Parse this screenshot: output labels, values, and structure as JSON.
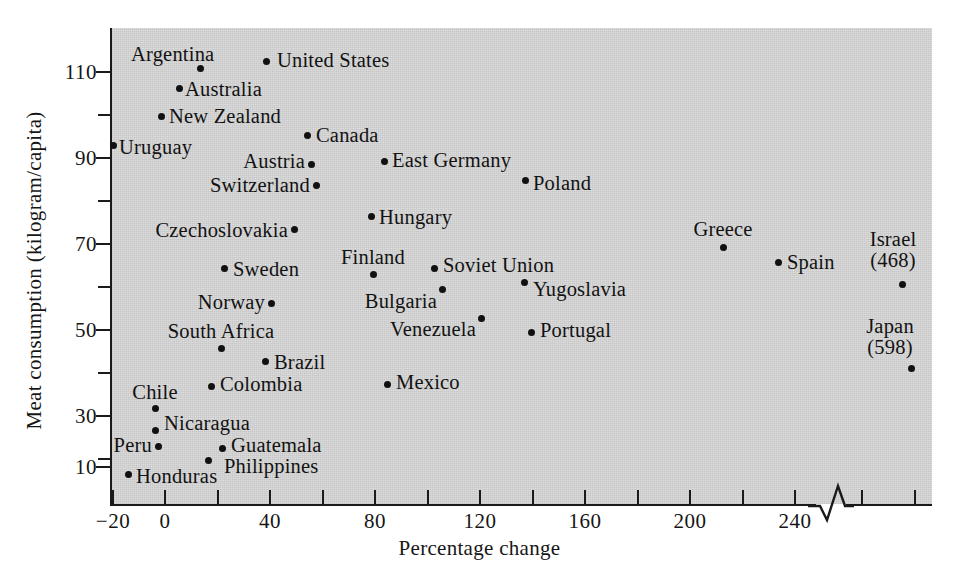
{
  "chart_data": {
    "type": "scatter",
    "title": "",
    "xlabel": "Percentage change",
    "ylabel": "Meat consumption (kilogram/capita)",
    "xlim": [
      -26,
      270
    ],
    "ylim": [
      0,
      118
    ],
    "grid": false,
    "legend": "none",
    "axis_break": {
      "present": true,
      "after_tick": 240,
      "style": "zigzag",
      "note": "x-axis is broken after 240; two rightmost points are plotted off-scale with their true values annotated in parentheses"
    },
    "xticks": [
      -20,
      0,
      20,
      40,
      60,
      80,
      100,
      120,
      140,
      160,
      180,
      200,
      220,
      240
    ],
    "xtick_labels": [
      "-20",
      "0",
      "",
      "40",
      "",
      "80",
      "",
      "120",
      "",
      "160",
      "",
      "200",
      "",
      "240"
    ],
    "yticks": [
      10,
      20,
      30,
      40,
      50,
      60,
      70,
      80,
      90,
      100,
      110
    ],
    "ytick_labels": [
      "10",
      "",
      "30",
      "",
      "50",
      "",
      "70",
      "",
      "90",
      "",
      "110"
    ],
    "points": [
      {
        "label": "Argentina",
        "x": 14,
        "y": 110,
        "label_pos": "above-left"
      },
      {
        "label": "United States",
        "x": 39,
        "y": 111,
        "label_pos": "right"
      },
      {
        "label": "Australia",
        "x": 11,
        "y": 105,
        "label_pos": "right"
      },
      {
        "label": "New Zealand",
        "x": 4,
        "y": 98,
        "label_pos": "right"
      },
      {
        "label": "Uruguay",
        "x": -20,
        "y": 90,
        "label_pos": "right"
      },
      {
        "label": "Canada",
        "x": 40,
        "y": 93,
        "label_pos": "right"
      },
      {
        "label": "Austria",
        "x": 41,
        "y": 85,
        "label_pos": "left"
      },
      {
        "label": "East Germany",
        "x": 56,
        "y": 86,
        "label_pos": "right"
      },
      {
        "label": "Switzerland",
        "x": 42,
        "y": 80,
        "label_pos": "left"
      },
      {
        "label": "Poland",
        "x": 134,
        "y": 82,
        "label_pos": "right"
      },
      {
        "label": "Czechoslovakia",
        "x": 24,
        "y": 69,
        "label_pos": "left"
      },
      {
        "label": "Hungary",
        "x": 77,
        "y": 72,
        "label_pos": "right"
      },
      {
        "label": "Greece",
        "x": 214,
        "y": 66,
        "label_pos": "above"
      },
      {
        "label": "Sweden",
        "x": 22,
        "y": 59,
        "label_pos": "right"
      },
      {
        "label": "Finland",
        "x": 79,
        "y": 58,
        "label_pos": "above"
      },
      {
        "label": "Soviet Union",
        "x": 104,
        "y": 59,
        "label_pos": "right"
      },
      {
        "label": "Spain",
        "x": 235,
        "y": 60,
        "label_pos": "right"
      },
      {
        "label": "Israel",
        "x": 468,
        "y": 56,
        "label_pos": "above",
        "offscale": true,
        "annotation": "(468)"
      },
      {
        "label": "Norway",
        "x": 20,
        "y": 52,
        "label_pos": "left"
      },
      {
        "label": "Bulgaria",
        "x": 104,
        "y": 54,
        "label_pos": "below-left"
      },
      {
        "label": "Yugoslavia",
        "x": 139,
        "y": 55,
        "label_pos": "right"
      },
      {
        "label": "South Africa",
        "x": 22,
        "y": 41,
        "label_pos": "above"
      },
      {
        "label": "Venezuela",
        "x": 120,
        "y": 47,
        "label_pos": "left"
      },
      {
        "label": "Portugal",
        "x": 139,
        "y": 43,
        "label_pos": "right"
      },
      {
        "label": "Japan",
        "x": 598,
        "y": 34,
        "label_pos": "above",
        "offscale": true,
        "annotation": "(598)"
      },
      {
        "label": "Brazil",
        "x": 38,
        "y": 36,
        "label_pos": "right"
      },
      {
        "label": "Colombia",
        "x": 20,
        "y": 31,
        "label_pos": "right"
      },
      {
        "label": "Mexico",
        "x": 86,
        "y": 30,
        "label_pos": "right"
      },
      {
        "label": "Chile",
        "x": -4,
        "y": 25,
        "label_pos": "above"
      },
      {
        "label": "Nicaragua",
        "x": -4,
        "y": 19,
        "label_pos": "right"
      },
      {
        "label": "Peru",
        "x": -3,
        "y": 16,
        "label_pos": "left"
      },
      {
        "label": "Guatemala",
        "x": 21,
        "y": 15,
        "label_pos": "right"
      },
      {
        "label": "Philippines",
        "x": 12,
        "y": 12,
        "label_pos": "below-right"
      },
      {
        "label": "Honduras",
        "x": -15,
        "y": 9,
        "label_pos": "right"
      }
    ]
  },
  "axes": {
    "xlabel": "Percentage change",
    "ylabel": "Meat consumption (kilogram/capita)",
    "xtick_labels": [
      {
        "value": -20,
        "text": "−20",
        "px": 113
      },
      {
        "value": 0,
        "text": "0",
        "px": 165
      },
      {
        "value": 20,
        "text": "",
        "px": 218
      },
      {
        "value": 40,
        "text": "40",
        "px": 270
      },
      {
        "value": 60,
        "text": "",
        "px": 323
      },
      {
        "value": 80,
        "text": "80",
        "px": 375
      },
      {
        "value": 100,
        "text": "",
        "px": 428
      },
      {
        "value": 120,
        "text": "120",
        "px": 480
      },
      {
        "value": 140,
        "text": "",
        "px": 533
      },
      {
        "value": 160,
        "text": "160",
        "px": 585
      },
      {
        "value": 180,
        "text": "",
        "px": 638
      },
      {
        "value": 200,
        "text": "200",
        "px": 690
      },
      {
        "value": 220,
        "text": "",
        "px": 743
      },
      {
        "value": 240,
        "text": "240",
        "px": 795
      },
      {
        "value": 260,
        "text": "",
        "px": 862
      },
      {
        "value": 280,
        "text": "",
        "px": 915
      }
    ],
    "ytick_labels": [
      {
        "value": 110,
        "text": "110",
        "px": 71,
        "major": true
      },
      {
        "value": 100,
        "text": "",
        "px": 114,
        "major": false
      },
      {
        "value": 90,
        "text": "90",
        "px": 157,
        "major": true
      },
      {
        "value": 80,
        "text": "",
        "px": 200,
        "major": false
      },
      {
        "value": 70,
        "text": "70",
        "px": 243,
        "major": true
      },
      {
        "value": 60,
        "text": "",
        "px": 286,
        "major": false
      },
      {
        "value": 50,
        "text": "50",
        "px": 329,
        "major": true
      },
      {
        "value": 40,
        "text": "",
        "px": 372,
        "major": false
      },
      {
        "value": 30,
        "text": "30",
        "px": 415,
        "major": true
      },
      {
        "value": 20,
        "text": "",
        "px": 458,
        "major": false
      },
      {
        "value": 10,
        "text": "10",
        "px": 466,
        "major": true
      }
    ]
  },
  "marks": [
    {
      "name": "Argentina",
      "dot": [
        200,
        68
      ],
      "label": "Argentina",
      "lx": 131,
      "ly": 55,
      "anchor": "left"
    },
    {
      "name": "United States",
      "dot": [
        266,
        61
      ],
      "label": "United States",
      "lx": 277,
      "ly": 61,
      "anchor": "left"
    },
    {
      "name": "Australia",
      "dot": [
        179,
        88
      ],
      "label": "Australia",
      "lx": 185,
      "ly": 90,
      "anchor": "left"
    },
    {
      "name": "New Zealand",
      "dot": [
        161,
        116
      ],
      "label": "New Zealand",
      "lx": 169,
      "ly": 117,
      "anchor": "left"
    },
    {
      "name": "Uruguay",
      "dot": [
        113,
        145
      ],
      "label": "Uruguay",
      "lx": 119,
      "ly": 148,
      "anchor": "left"
    },
    {
      "name": "Canada",
      "dot": [
        307,
        135
      ],
      "label": "Canada",
      "lx": 316,
      "ly": 136,
      "anchor": "left"
    },
    {
      "name": "Austria",
      "dot": [
        311,
        164
      ],
      "label": "Austria",
      "lx": 305,
      "ly": 162,
      "anchor": "right"
    },
    {
      "name": "East Germany",
      "dot": [
        384,
        161
      ],
      "label": "East Germany",
      "lx": 392,
      "ly": 161,
      "anchor": "left"
    },
    {
      "name": "Switzerland",
      "dot": [
        316,
        185
      ],
      "label": "Switzerland",
      "lx": 310,
      "ly": 186,
      "anchor": "right"
    },
    {
      "name": "Poland",
      "dot": [
        525,
        180
      ],
      "label": "Poland",
      "lx": 533,
      "ly": 184,
      "anchor": "left"
    },
    {
      "name": "Czechoslovakia",
      "dot": [
        294,
        229
      ],
      "label": "Czechoslovakia",
      "lx": 288,
      "ly": 231,
      "anchor": "right"
    },
    {
      "name": "Hungary",
      "dot": [
        371,
        216
      ],
      "label": "Hungary",
      "lx": 379,
      "ly": 218,
      "anchor": "left"
    },
    {
      "name": "Greece",
      "dot": [
        723,
        247
      ],
      "label": "Greece",
      "lx": 723,
      "ly": 230,
      "anchor": "center"
    },
    {
      "name": "Sweden",
      "dot": [
        224,
        268
      ],
      "label": "Sweden",
      "lx": 233,
      "ly": 270,
      "anchor": "left"
    },
    {
      "name": "Finland",
      "dot": [
        373,
        274
      ],
      "label": "Finland",
      "lx": 373,
      "ly": 258,
      "anchor": "center"
    },
    {
      "name": "Soviet Union",
      "dot": [
        434,
        268
      ],
      "label": "Soviet Union",
      "lx": 443,
      "ly": 266,
      "anchor": "left"
    },
    {
      "name": "Spain",
      "dot": [
        778,
        262
      ],
      "label": "Spain",
      "lx": 787,
      "ly": 263,
      "anchor": "left"
    },
    {
      "name": "Israel",
      "dot": [
        902,
        284
      ],
      "label": "Israel\n(468)",
      "lx": 893,
      "ly": 250,
      "anchor": "center"
    },
    {
      "name": "Norway",
      "dot": [
        271,
        303
      ],
      "label": "Norway",
      "lx": 265,
      "ly": 303,
      "anchor": "right"
    },
    {
      "name": "Bulgaria",
      "dot": [
        442,
        289
      ],
      "label": "Bulgaria",
      "lx": 437,
      "ly": 302,
      "anchor": "right"
    },
    {
      "name": "Yugoslavia",
      "dot": [
        524,
        282
      ],
      "label": "Yugoslavia",
      "lx": 533,
      "ly": 290,
      "anchor": "left"
    },
    {
      "name": "South Africa",
      "dot": [
        221,
        348
      ],
      "label": "South Africa",
      "lx": 221,
      "ly": 332,
      "anchor": "center"
    },
    {
      "name": "Venezuela",
      "dot": [
        481,
        318
      ],
      "label": "Venezuela",
      "lx": 476,
      "ly": 330,
      "anchor": "right"
    },
    {
      "name": "Portugal",
      "dot": [
        531,
        332
      ],
      "label": "Portugal",
      "lx": 540,
      "ly": 331,
      "anchor": "left"
    },
    {
      "name": "Japan",
      "dot": [
        911,
        368
      ],
      "label": "Japan\n(598)",
      "lx": 890,
      "ly": 337,
      "anchor": "center"
    },
    {
      "name": "Brazil",
      "dot": [
        265,
        361
      ],
      "label": "Brazil",
      "lx": 274,
      "ly": 363,
      "anchor": "left"
    },
    {
      "name": "Colombia",
      "dot": [
        211,
        386
      ],
      "label": "Colombia",
      "lx": 220,
      "ly": 385,
      "anchor": "left"
    },
    {
      "name": "Mexico",
      "dot": [
        387,
        384
      ],
      "label": "Mexico",
      "lx": 396,
      "ly": 383,
      "anchor": "left"
    },
    {
      "name": "Chile",
      "dot": [
        155,
        408
      ],
      "label": "Chile",
      "lx": 155,
      "ly": 393,
      "anchor": "center"
    },
    {
      "name": "Nicaragua",
      "dot": [
        155,
        430
      ],
      "label": "Nicaragua",
      "lx": 164,
      "ly": 424,
      "anchor": "left"
    },
    {
      "name": "Peru",
      "dot": [
        158,
        446
      ],
      "label": "Peru",
      "lx": 152,
      "ly": 446,
      "anchor": "right"
    },
    {
      "name": "Guatemala",
      "dot": [
        222,
        448
      ],
      "label": "Guatemala",
      "lx": 231,
      "ly": 446,
      "anchor": "left"
    },
    {
      "name": "Philippines",
      "dot": [
        208,
        460
      ],
      "label": "Philippines",
      "lx": 224,
      "ly": 467,
      "anchor": "left"
    },
    {
      "name": "Honduras",
      "dot": [
        128,
        474
      ],
      "label": "Honduras",
      "lx": 136,
      "ly": 477,
      "anchor": "left"
    }
  ]
}
